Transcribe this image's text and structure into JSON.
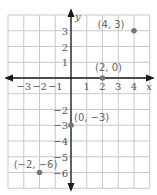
{
  "chart_data": {
    "type": "scatter",
    "title": "",
    "xlabel": "x",
    "ylabel": "y",
    "xlim": [
      -4,
      5
    ],
    "ylim": [
      -7,
      4
    ],
    "grid": true,
    "x_ticks": [
      "−3",
      "−2",
      "−1",
      "1",
      "2",
      "3",
      "4"
    ],
    "y_ticks": [
      "3",
      "2",
      "1",
      "−2",
      "−3",
      "−4",
      "−5",
      "−6"
    ],
    "points": [
      {
        "x": 4,
        "y": 3,
        "label": "(4, 3)"
      },
      {
        "x": 2,
        "y": 0,
        "label": "(2, 0)"
      },
      {
        "x": 0,
        "y": -3,
        "label": "(0, −3)"
      },
      {
        "x": -2,
        "y": -6,
        "label": "(−2, −6)"
      }
    ],
    "colors": {
      "grid": "#c8c8c8",
      "axis": "#1a1a1a",
      "point": "#777777"
    }
  }
}
